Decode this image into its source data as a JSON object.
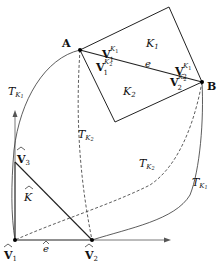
{
  "diagram": {
    "points": {
      "A": {
        "label": "A",
        "x": 80,
        "y": 50
      },
      "B": {
        "label": "B",
        "x": 202,
        "y": 82
      },
      "V1hat": {
        "label": "V",
        "sub": "1",
        "x": 15,
        "y": 240
      },
      "V2hat": {
        "label": "V",
        "sub": "2",
        "x": 92,
        "y": 240
      },
      "V3hat": {
        "label": "V",
        "sub": "3",
        "x": 15,
        "y": 162
      }
    },
    "elements": {
      "K1": {
        "label": "K",
        "sub": "1"
      },
      "K2": {
        "label": "K",
        "sub": "2"
      },
      "Khat": {
        "label": "K"
      }
    },
    "edges": {
      "e": {
        "label": "e"
      },
      "ehat": {
        "label": "e"
      }
    },
    "vertex_labels": {
      "V1K1": {
        "main": "V",
        "sub": "1",
        "sup": "K",
        "supsub": "1"
      },
      "V1K2": {
        "main": "V",
        "sub": "1",
        "sup": "K",
        "supsub": "2"
      },
      "V2K1": {
        "main": "V",
        "sub": "2",
        "sup": "K",
        "supsub": "1"
      },
      "V2K2": {
        "main": "V",
        "sub": "2",
        "sup": "K",
        "supsub": "2"
      }
    },
    "maps": {
      "TK1_left": {
        "main": "T",
        "sub": "K",
        "subsub": "1"
      },
      "TK1_right": {
        "main": "T",
        "sub": "K",
        "subsub": "1"
      },
      "TK2_mid": {
        "main": "T",
        "sub": "K",
        "subsub": "2"
      },
      "TK2_right": {
        "main": "T",
        "sub": "K",
        "subsub": "2"
      }
    },
    "colors": {
      "stroke": "#222222",
      "text": "#111111",
      "background": "#ffffff"
    }
  }
}
